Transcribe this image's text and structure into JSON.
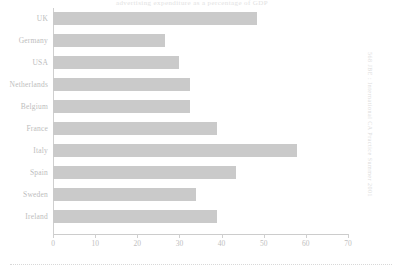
{
  "figure": {
    "title_partial": "advertising expenditure as a percentage of GDP",
    "side_caption": "568  JBE : International CA Practice Summer 2001",
    "axis_color": "#cccccc",
    "bar_color": "#cacaca",
    "text_color": "#bdbdbd"
  },
  "chart_data": {
    "type": "bar",
    "orientation": "horizontal",
    "title": "advertising expenditure as a percentage of GDP",
    "xlabel": "",
    "ylabel": "",
    "categories": [
      "UK",
      "Germany",
      "USA",
      "Netherlands",
      "Belgium",
      "France",
      "Italy",
      "Spain",
      "Sweden",
      "Ireland"
    ],
    "values": [
      48.5,
      26.5,
      30.0,
      32.5,
      32.5,
      39.0,
      58.0,
      43.5,
      34.0,
      39.0
    ],
    "xlim": [
      0,
      70
    ],
    "xticks": [
      0,
      10,
      20,
      30,
      40,
      50,
      60,
      70
    ],
    "xtick_labels": [
      "0",
      "10",
      "20",
      "30",
      "40",
      "50",
      "60",
      "70"
    ],
    "grid": false,
    "legend": "none",
    "series": [
      {
        "name": "value",
        "values": [
          48.5,
          26.5,
          30.0,
          32.5,
          32.5,
          39.0,
          58.0,
          43.5,
          34.0,
          39.0
        ]
      }
    ]
  }
}
